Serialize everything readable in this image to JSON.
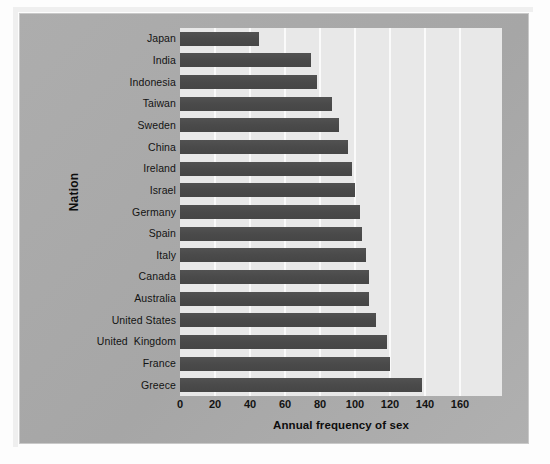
{
  "figure": {
    "panel_color": "#a9a9a9",
    "plot_background": "#e8e8e8",
    "bar_color": "#4e4e4e",
    "gridline_color": "#fafafa"
  },
  "chart_data": {
    "type": "bar",
    "orientation": "horizontal",
    "title": "",
    "xlabel": "Annual frequency of sex",
    "ylabel": "Nation",
    "categories": [
      "Japan",
      "India",
      "Indonesia",
      "Taiwan",
      "Sweden",
      "China",
      "Ireland",
      "Israel",
      "Germany",
      "Spain",
      "Italy",
      "Canada",
      "Australia",
      "United States",
      "United  Kingdom",
      "France",
      "Greece"
    ],
    "values": [
      45,
      75,
      78,
      87,
      91,
      96,
      98,
      100,
      103,
      104,
      106,
      108,
      108,
      112,
      118,
      120,
      138
    ],
    "xlim": [
      0,
      184
    ],
    "xticks": [
      0,
      20,
      40,
      60,
      80,
      100,
      120,
      140,
      160
    ],
    "xticklabels": [
      "0",
      "20",
      "40",
      "60",
      "80",
      "100",
      "120",
      "140",
      "160"
    ],
    "grid": true,
    "grid_axis": "x",
    "legend": false,
    "legend_position": "none"
  }
}
